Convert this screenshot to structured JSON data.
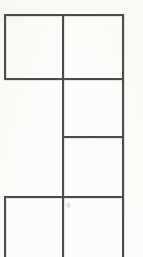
{
  "document": {
    "kind": "scanned-table-fragment",
    "background_color": "#fcfcfa",
    "line_color": "#4b4b4b",
    "width": 143,
    "height": 257,
    "description": "Partial hand-ruled table grid from a scanned page, cropped at the bottom edge",
    "visible_text": "",
    "cell_count": 5
  },
  "grid": {
    "columns": [
      {
        "name": "left-column",
        "x_start": 4,
        "x_end": 62
      },
      {
        "name": "right-column",
        "x_start": 62,
        "x_end": 123
      }
    ],
    "vertical_rules": [
      {
        "name": "left-rule-upper",
        "x": 4,
        "y_start": 14,
        "y_end": 80
      },
      {
        "name": "left-rule-lower",
        "x": 4,
        "y_start": 196,
        "y_end": 257
      },
      {
        "name": "center-rule",
        "x": 62,
        "y_start": 14,
        "y_end": 257
      },
      {
        "name": "right-rule",
        "x": 122,
        "y_start": 14,
        "y_end": 257
      }
    ],
    "horizontal_rules": [
      {
        "name": "rule-top",
        "y": 14,
        "x_start": 4,
        "x_end": 124
      },
      {
        "name": "rule-second",
        "y": 78,
        "x_start": 4,
        "x_end": 124
      },
      {
        "name": "rule-third",
        "y": 136,
        "x_start": 62,
        "x_end": 124
      },
      {
        "name": "rule-fourth",
        "y": 196,
        "x_start": 4,
        "x_end": 124
      }
    ],
    "cells": [
      {
        "name": "cell-row1-left",
        "x": 4,
        "y": 14,
        "w": 58,
        "h": 64,
        "value": ""
      },
      {
        "name": "cell-row1-right",
        "x": 62,
        "y": 14,
        "w": 60,
        "h": 64,
        "value": ""
      },
      {
        "name": "cell-row2-right",
        "x": 62,
        "y": 78,
        "w": 60,
        "h": 58,
        "value": ""
      },
      {
        "name": "cell-row3-right",
        "x": 62,
        "y": 136,
        "w": 60,
        "h": 60,
        "value": ""
      },
      {
        "name": "cell-row4-left",
        "x": 4,
        "y": 196,
        "w": 58,
        "h": 61,
        "value": ""
      },
      {
        "name": "cell-row4-right",
        "x": 62,
        "y": 196,
        "w": 60,
        "h": 61,
        "value": ""
      }
    ],
    "gap_region": {
      "name": "left-column-gap",
      "x": 4,
      "y": 78,
      "w": 58,
      "h": 118,
      "note": "left column is unruled between the second and fourth horizontal rules"
    }
  },
  "artifacts": [
    {
      "name": "faint-speck",
      "x": 66,
      "y": 202,
      "w": 5,
      "h": 7,
      "color": "#9a9a9a"
    }
  ]
}
